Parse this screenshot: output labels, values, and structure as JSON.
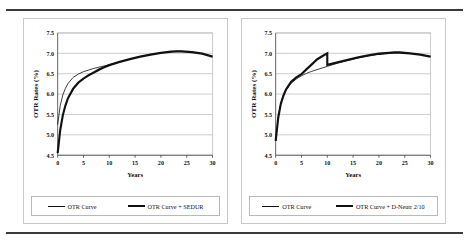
{
  "figure": {
    "background": "#ffffff",
    "rule_color": "#3a3a3a",
    "panel_border": "#c9c9c9"
  },
  "chart_data": [
    {
      "type": "line",
      "title": "",
      "xlabel": "Years",
      "ylabel": "OTR Rates (%)",
      "xlim": [
        0,
        30
      ],
      "ylim": [
        4.5,
        7.5
      ],
      "xticks": [
        0,
        5,
        10,
        15,
        20,
        25,
        30
      ],
      "yticks": [
        4.5,
        5.0,
        5.5,
        6.0,
        6.5,
        7.0,
        7.5
      ],
      "ytick_labels": [
        "4.5",
        "5.0",
        "5.5",
        "6.0",
        "6.5",
        "7.0",
        "7.5"
      ],
      "xtick_labels": [
        "0",
        "5",
        "10",
        "15",
        "20",
        "25",
        "30"
      ],
      "grid": "horizontal",
      "legend_position": "bottom",
      "x": [
        0,
        0.5,
        1,
        1.5,
        2,
        3,
        4,
        5,
        6,
        7,
        8,
        9,
        10,
        12,
        14,
        16,
        18,
        20,
        22,
        23,
        24,
        26,
        28,
        30
      ],
      "series": [
        {
          "name": "OTR Curve",
          "style": "thin",
          "color": "#111111",
          "values": [
            5.25,
            5.72,
            5.98,
            6.14,
            6.26,
            6.41,
            6.49,
            6.55,
            6.59,
            6.63,
            6.66,
            6.69,
            6.72,
            6.79,
            6.86,
            6.92,
            6.97,
            7.01,
            7.04,
            7.05,
            7.05,
            7.03,
            6.99,
            6.92
          ]
        },
        {
          "name": "OTR Curve + SEDUR",
          "style": "thick",
          "color": "#111111",
          "values": [
            4.55,
            5.12,
            5.48,
            5.72,
            5.9,
            6.13,
            6.28,
            6.38,
            6.46,
            6.53,
            6.6,
            6.66,
            6.71,
            6.79,
            6.86,
            6.92,
            6.97,
            7.01,
            7.04,
            7.05,
            7.05,
            7.03,
            6.99,
            6.92
          ]
        }
      ]
    },
    {
      "type": "line",
      "title": "",
      "xlabel": "Years",
      "ylabel": "OTR Rates (%)",
      "xlim": [
        0,
        30
      ],
      "ylim": [
        4.5,
        7.5
      ],
      "xticks": [
        0,
        5,
        10,
        15,
        20,
        25,
        30
      ],
      "yticks": [
        4.5,
        5.0,
        5.5,
        6.0,
        6.5,
        7.0,
        7.5
      ],
      "ytick_labels": [
        "4.5",
        "5.0",
        "5.5",
        "6.0",
        "6.5",
        "7.0",
        "7.5"
      ],
      "xtick_labels": [
        "0",
        "5",
        "10",
        "15",
        "20",
        "25",
        "30"
      ],
      "grid": "horizontal",
      "legend_position": "bottom",
      "x": [
        0,
        0.5,
        1,
        1.5,
        2,
        3,
        4,
        5,
        6,
        7,
        8,
        9,
        10,
        12,
        14,
        16,
        18,
        20,
        22,
        23,
        24,
        26,
        28,
        30
      ],
      "series": [
        {
          "name": "OTR Curve",
          "style": "thin",
          "color": "#111111",
          "values": [
            4.85,
            5.45,
            5.78,
            5.97,
            6.1,
            6.27,
            6.37,
            6.45,
            6.51,
            6.56,
            6.6,
            6.64,
            6.68,
            6.76,
            6.83,
            6.89,
            6.94,
            6.98,
            7.01,
            7.02,
            7.02,
            7.0,
            6.97,
            6.92
          ]
        },
        {
          "name": "OTR Curve + D-Neutr 2/10",
          "style": "thick",
          "color": "#111111",
          "spike": {
            "x": 10,
            "peak": 7.0,
            "drop_to": 6.72
          },
          "values": [
            4.85,
            5.42,
            5.76,
            5.96,
            6.11,
            6.3,
            6.41,
            6.49,
            6.61,
            6.73,
            6.85,
            6.93,
            7.0,
            6.78,
            6.84,
            6.9,
            6.95,
            6.99,
            7.01,
            7.02,
            7.02,
            7.0,
            6.97,
            6.92
          ]
        }
      ]
    }
  ],
  "panels": [
    {
      "id": "left",
      "legend": [
        {
          "label": "OTR Curve",
          "style": "thin"
        },
        {
          "label": "OTR Curve + SEDUR",
          "style": "thick"
        }
      ]
    },
    {
      "id": "right",
      "legend": [
        {
          "label": "OTR Curve",
          "style": "thin"
        },
        {
          "label": "OTR Curve + D-Neutr 2/10",
          "style": "thick"
        }
      ]
    }
  ]
}
